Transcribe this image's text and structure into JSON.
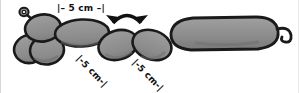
{
  "figure": {
    "background_color": "#ffffff",
    "balloon_fill": "#8c8c8c",
    "balloon_fill_light": "#9a9a9a",
    "balloon_shadow": "#6e6e6e",
    "outline_color": "#1a1a1a",
    "arrow_color": "#111111",
    "label_color": "#111111"
  },
  "labels": {
    "top": "|– 5 cm –|",
    "middle": "|-5 cm-|",
    "right": "|-5 cm-|"
  },
  "annotations": {
    "arrow": {
      "name": "double-headed-curved-arrow",
      "meaning": "bending range"
    }
  },
  "parts": [
    {
      "name": "knot-nub",
      "label": "knot"
    },
    {
      "name": "head-lobe-upper",
      "label": "upper head lobe"
    },
    {
      "name": "head-lobe-lower-left",
      "label": "lower left lobe"
    },
    {
      "name": "head-lobe-lower-right",
      "label": "lower right lobe"
    },
    {
      "name": "neck-segment",
      "label": "neck segment"
    },
    {
      "name": "mid-segment-left",
      "label": "left mid segment"
    },
    {
      "name": "mid-segment-right",
      "label": "right mid segment"
    },
    {
      "name": "body-segment",
      "label": "long body segment"
    },
    {
      "name": "tail-curl",
      "label": "tail curl"
    }
  ]
}
